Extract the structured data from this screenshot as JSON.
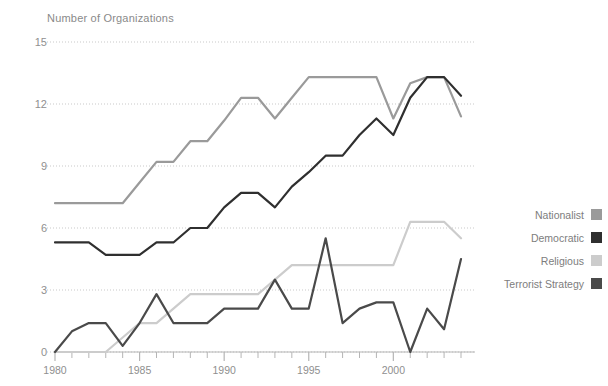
{
  "chart_data": {
    "type": "line",
    "title": "Number of Organizations",
    "xlabel": "",
    "ylabel": "Number of Organizations",
    "xlim": [
      1980,
      2004
    ],
    "ylim": [
      0,
      15.8
    ],
    "yticks": [
      0,
      3,
      6,
      9,
      12,
      15
    ],
    "ytick_labels": [
      "0",
      "3",
      "6",
      "9",
      "12",
      "15"
    ],
    "xticks": [
      1980,
      1985,
      1990,
      1995,
      2000
    ],
    "xtick_labels": [
      "1980",
      "1985",
      "1990",
      "1995",
      "2000"
    ],
    "minor_xtick_interval": 1,
    "grid": "horizontal-dotted",
    "legend_position": "right",
    "x": [
      1980,
      1981,
      1982,
      1983,
      1984,
      1985,
      1986,
      1987,
      1988,
      1989,
      1990,
      1991,
      1992,
      1993,
      1994,
      1995,
      1996,
      1997,
      1998,
      1999,
      2000,
      2001,
      2002,
      2003,
      2004
    ],
    "series": [
      {
        "name": "Nationalist",
        "color": "#9a9a9a",
        "values": [
          7.2,
          7.2,
          7.2,
          7.2,
          7.2,
          8.2,
          9.2,
          9.2,
          10.2,
          10.2,
          11.2,
          12.3,
          12.3,
          11.3,
          12.3,
          13.3,
          13.3,
          13.3,
          13.3,
          13.3,
          11.3,
          13.0,
          13.3,
          13.3,
          11.4
        ]
      },
      {
        "name": "Democratic",
        "color": "#2f2f2f",
        "values": [
          5.3,
          5.3,
          5.3,
          4.7,
          4.7,
          4.7,
          5.3,
          5.3,
          6.0,
          6.0,
          7.0,
          7.7,
          7.7,
          7.0,
          8.0,
          8.7,
          9.5,
          9.5,
          10.5,
          11.3,
          10.5,
          12.3,
          13.3,
          13.3,
          12.4
        ]
      },
      {
        "name": "Religious",
        "color": "#cccccc",
        "values": [
          0.0,
          0.0,
          0.0,
          0.0,
          0.7,
          1.4,
          1.4,
          2.1,
          2.8,
          2.8,
          2.8,
          2.8,
          2.8,
          3.5,
          4.2,
          4.2,
          4.2,
          4.2,
          4.2,
          4.2,
          4.2,
          6.3,
          6.3,
          6.3,
          5.5
        ]
      },
      {
        "name": "Terrorist Strategy",
        "color": "#4a4a4a",
        "values": [
          0.0,
          1.0,
          1.4,
          1.4,
          0.3,
          1.4,
          2.8,
          1.4,
          1.4,
          1.4,
          2.1,
          2.1,
          2.1,
          3.5,
          2.1,
          2.1,
          5.5,
          1.4,
          2.1,
          2.4,
          2.4,
          0.0,
          2.1,
          1.1,
          4.5
        ]
      }
    ]
  },
  "legend": {
    "items": [
      {
        "label": "Nationalist",
        "color": "#9a9a9a"
      },
      {
        "label": "Democratic",
        "color": "#2f2f2f"
      },
      {
        "label": "Religious",
        "color": "#cccccc"
      },
      {
        "label": "Terrorist Strategy",
        "color": "#4a4a4a"
      }
    ]
  },
  "axes": {
    "title": "Number of Organizations"
  }
}
